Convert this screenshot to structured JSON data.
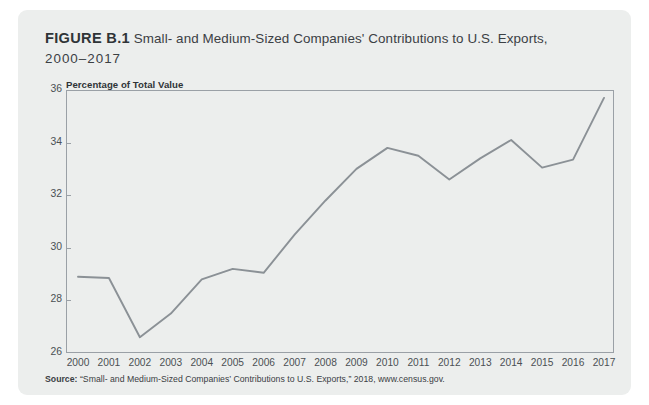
{
  "figure": {
    "label": "FIGURE B.1",
    "title_main": "Small- and Medium-Sized Companies' Contributions to U.S. Exports,",
    "title_years": "2000–2017",
    "source_label": "Source:",
    "source_text": " “Small- and Medium-Sized Companies’ Contributions to U.S. Exports,” 2018, www.census.gov."
  },
  "colors": {
    "card_background": "#eceeed",
    "line": "#8b9196",
    "axis": "#9aa0a6",
    "title_text": "#3b4044",
    "tick_text": "#4b5054"
  },
  "chart_data": {
    "type": "line",
    "xlabel": "",
    "ylabel": "Percentage of Total Value",
    "ylim": [
      26,
      36
    ],
    "yticks": [
      26,
      28,
      30,
      32,
      34,
      36
    ],
    "ytick_labels": [
      "26",
      "28",
      "30",
      "32",
      "34",
      "36"
    ],
    "grid": false,
    "legend": null,
    "categories": [
      "2000",
      "2001",
      "2002",
      "2003",
      "2004",
      "2005",
      "2006",
      "2007",
      "2008",
      "2009",
      "2010",
      "2011",
      "2012",
      "2013",
      "2014",
      "2015",
      "2016",
      "2017"
    ],
    "x": [
      2000,
      2001,
      2002,
      2003,
      2004,
      2005,
      2006,
      2007,
      2008,
      2009,
      2010,
      2011,
      2012,
      2013,
      2014,
      2015,
      2016,
      2017
    ],
    "values": [
      28.9,
      28.85,
      26.6,
      27.5,
      28.8,
      29.2,
      29.05,
      30.5,
      31.8,
      33.0,
      33.8,
      33.5,
      32.6,
      33.4,
      34.1,
      33.05,
      33.35,
      35.7
    ],
    "series": [
      {
        "name": "Percentage of Total Value",
        "values": [
          28.9,
          28.85,
          26.6,
          27.5,
          28.8,
          29.2,
          29.05,
          30.5,
          31.8,
          33.0,
          33.8,
          33.5,
          32.6,
          33.4,
          34.1,
          33.05,
          33.35,
          35.7
        ]
      }
    ]
  }
}
